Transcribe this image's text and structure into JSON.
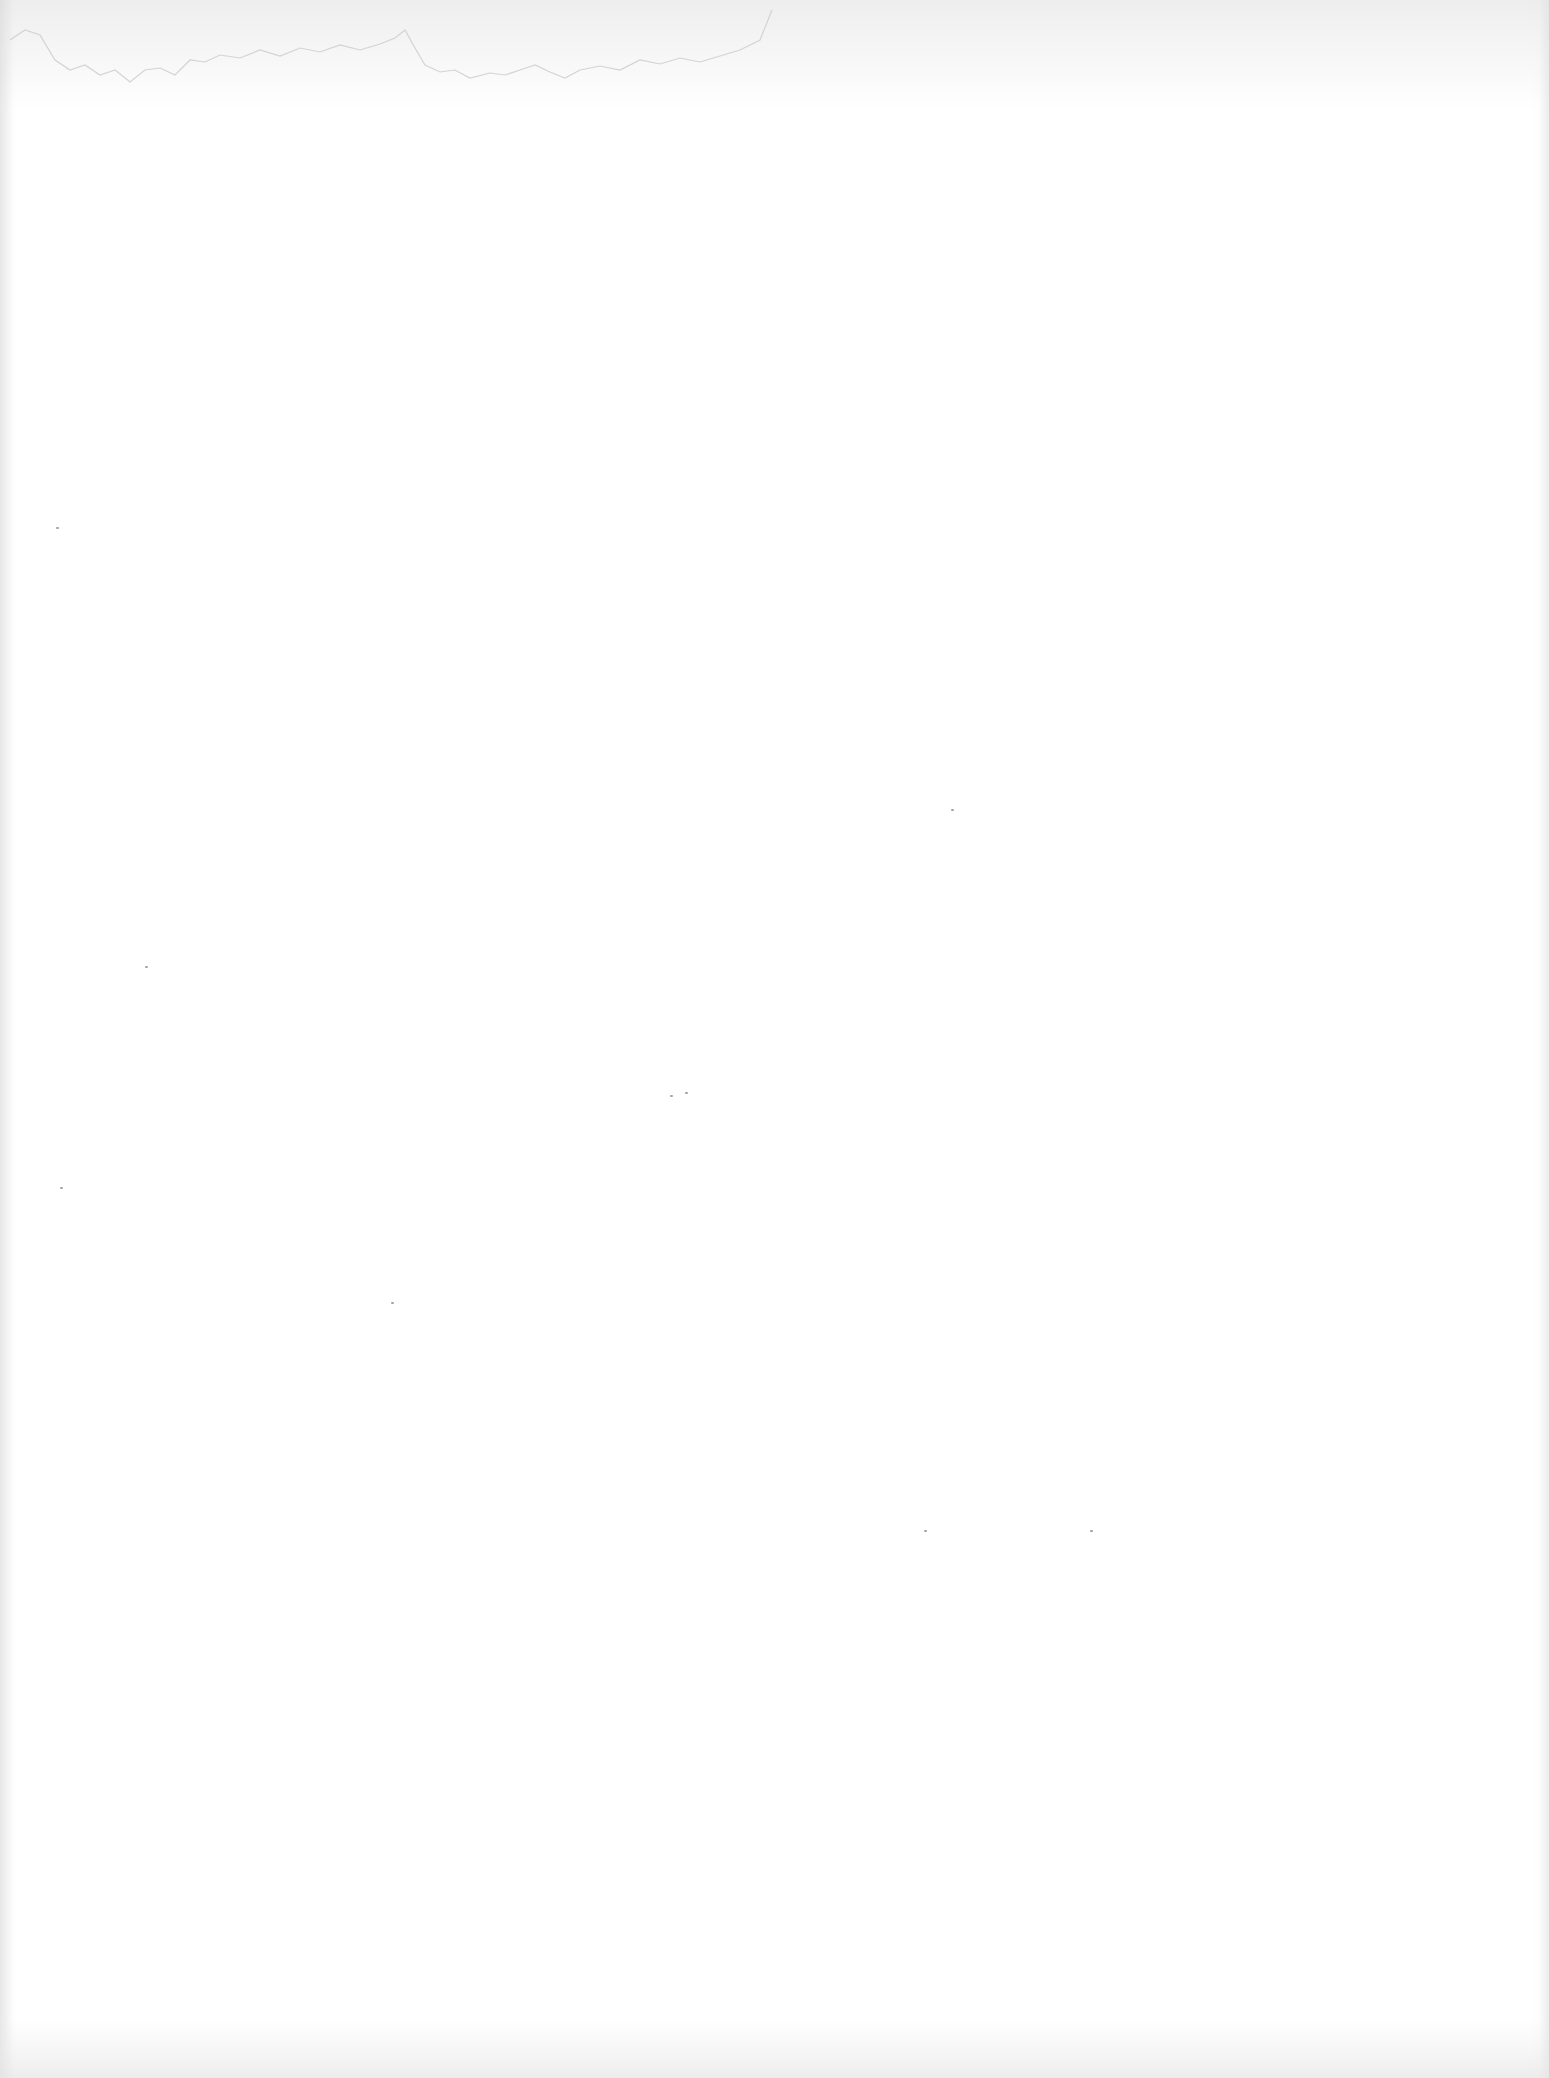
{
  "page": {
    "type": "blank-scanned-page",
    "text": "",
    "background_color": "#ffffff",
    "stain_color": "#cfcfcf"
  },
  "specks": [
    {
      "x": 56,
      "y": 527
    },
    {
      "x": 145,
      "y": 966
    },
    {
      "x": 951,
      "y": 809
    },
    {
      "x": 670,
      "y": 1095
    },
    {
      "x": 685,
      "y": 1092
    },
    {
      "x": 60,
      "y": 1187
    },
    {
      "x": 391,
      "y": 1302
    },
    {
      "x": 924,
      "y": 1530
    },
    {
      "x": 1090,
      "y": 1530
    }
  ]
}
